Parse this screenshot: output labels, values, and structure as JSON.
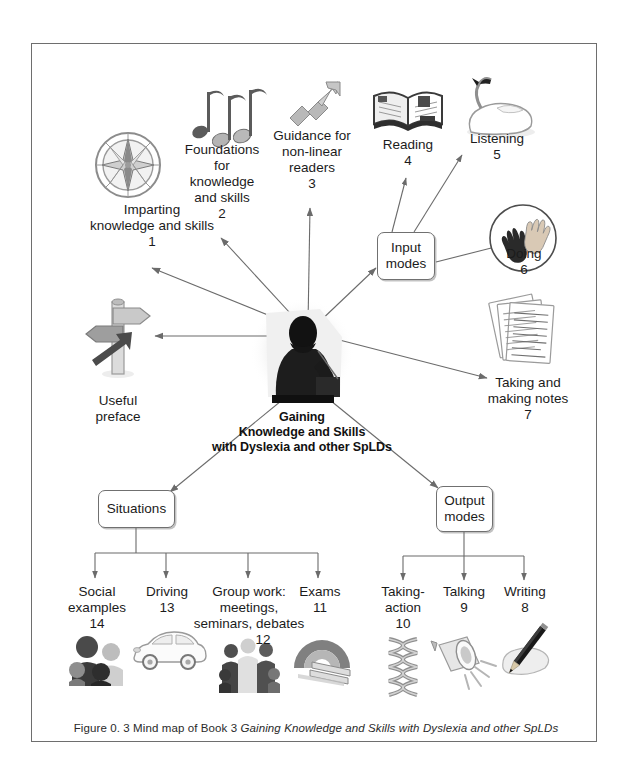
{
  "figure": {
    "caption_prefix": "Figure 0. 3  Mind map of Book 3",
    "caption_title": "Gaining Knowledge and Skills with Dyslexia and other SpLDs"
  },
  "hub": {
    "line1": "Gaining",
    "line2": "Knowledge and Skills",
    "line3": "with Dyslexia and other SpLDs",
    "icon": "seated-person-icon"
  },
  "boxes": {
    "input_modes": "Input\nmodes",
    "input_modes_line1": "Input",
    "input_modes_line2": "modes",
    "situations": "Situations",
    "output_modes_line1": "Output",
    "output_modes_line2": "modes"
  },
  "nodes": {
    "imparting": {
      "label": "Imparting\nknowledge and skills",
      "line1": "Imparting",
      "line2": "knowledge and skills",
      "number": "1",
      "icon": "compass-icon"
    },
    "foundations": {
      "line1": "Foundations",
      "line2": "for",
      "line3": "knowledge",
      "line4": "and skills",
      "number": "2",
      "icon": "music-notes-icon"
    },
    "guidance": {
      "line1": "Guidance for",
      "line2": "non-linear",
      "line3": "readers",
      "number": "3",
      "icon": "zigzag-arrow-icon"
    },
    "reading": {
      "line1": "Reading",
      "number": "4",
      "icon": "open-book-icon"
    },
    "listening": {
      "line1": "Listening",
      "number": "5",
      "icon": "swan-icon"
    },
    "doing": {
      "line1": "Doing",
      "number": "6",
      "icon": "handprints-icon"
    },
    "notes": {
      "line1": "Taking and",
      "line2": "making notes",
      "number": "7",
      "icon": "note-pages-icon"
    },
    "writing": {
      "line1": "Writing",
      "number": "8",
      "icon": "pencil-icon"
    },
    "talking": {
      "line1": "Talking",
      "number": "9",
      "icon": "megaphone-icon"
    },
    "taking_action": {
      "line1": "Taking-",
      "line2": "action",
      "number": "10",
      "icon": "helix-icon"
    },
    "exams": {
      "line1": "Exams",
      "number": "11",
      "icon": "arch-books-icon"
    },
    "group_work": {
      "line1": "Group work:",
      "line2": "meetings,",
      "line3": "seminars, debates",
      "number": "12",
      "icon": "group-people-icon"
    },
    "driving": {
      "line1": "Driving",
      "number": "13",
      "icon": "car-icon"
    },
    "social": {
      "line1": "Social",
      "line2": "examples",
      "number": "14",
      "icon": "faces-icon"
    },
    "useful_preface": {
      "line1": "Useful",
      "line2": "preface",
      "number": "",
      "icon": "signpost-icon"
    }
  },
  "colors": {
    "frame": "#6e6e6e",
    "line": "#6b6b6b",
    "text": "#1b1b1b",
    "icon_gray": "#9a9a9a",
    "icon_dark": "#4a4a4a"
  }
}
